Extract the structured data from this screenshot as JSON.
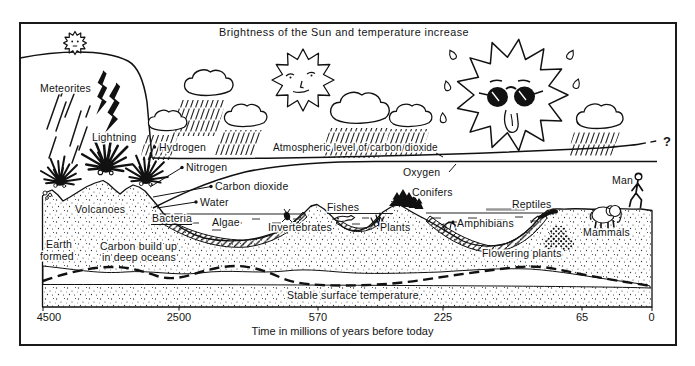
{
  "title": "Brightness of the Sun and temperature increase",
  "atmosphere": {
    "hydrogen": "Hydrogen",
    "nitrogen": "Nitrogen",
    "carbon_dioxide": "Carbon dioxide",
    "water": "Water",
    "co2_level_label": "Atmospheric level of carbon dioxide",
    "oxygen": "Oxygen",
    "future_uncertainty": "?"
  },
  "events": {
    "meteorites": "Meteorites",
    "lightning": "Lightning",
    "volcanoes": "Volcanoes"
  },
  "life": {
    "bacteria": "Bacteria",
    "algae": "Algae",
    "invertebrates": "Invertebrates",
    "fishes": "Fishes",
    "plants": "Plants",
    "conifers": "Conifers",
    "amphibians": "Amphibians",
    "reptiles": "Reptiles",
    "flowering_plants": "Flowering plants",
    "mammals": "Mammals",
    "man": "Man"
  },
  "earth": {
    "earth_formed_line1": "Earth",
    "earth_formed_line2": "formed",
    "carbon_buildup_line1": "Carbon build up",
    "carbon_buildup_line2": "in deep oceans",
    "stable_temperature": "Stable surface temperature"
  },
  "axis": {
    "ticks": [
      "4500",
      "2500",
      "570",
      "225",
      "65",
      "0"
    ],
    "caption": "Time in millions of years before today"
  },
  "colors": {
    "ink": "#1a1a1a",
    "paper": "#ffffff",
    "water_shading": "#9a9a9a"
  }
}
